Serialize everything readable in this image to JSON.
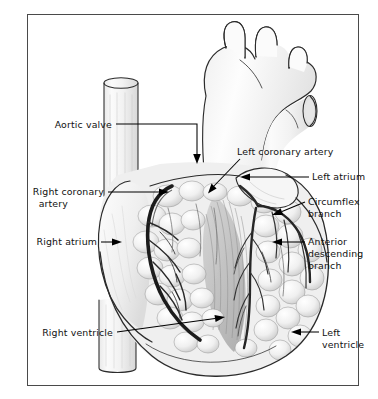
{
  "figure": {
    "frame": {
      "present": true,
      "color": "#4a4a4a"
    },
    "background": "#ffffff",
    "ink_color": "#2b2b2b"
  },
  "labels": [
    {
      "id": "aortic-valve",
      "text": "Aortic valve",
      "side": "left",
      "text_x": 112,
      "text_y": 128,
      "pointer": "arrow-down",
      "leader": "M116,124 L197,124 L197,157",
      "arrow_tip": {
        "x": 197,
        "y": 163
      },
      "arrow_dir": "down"
    },
    {
      "id": "right-coronary-artery",
      "text": "Right coronary",
      "text2": "artery",
      "side": "left",
      "text_x": 104,
      "text_y": 195,
      "text2_y": 207,
      "pointer": "arrow-right",
      "leader": "M108,192 L160,192",
      "arrow_tip": {
        "x": 168,
        "y": 192
      },
      "arrow_dir": "right"
    },
    {
      "id": "right-atrium",
      "text": "Right atrium",
      "side": "left",
      "text_x": 97,
      "text_y": 245,
      "pointer": "arrow-right",
      "leader": "M101,242 L113,242",
      "arrow_tip": {
        "x": 122,
        "y": 242
      },
      "arrow_dir": "right"
    },
    {
      "id": "right-ventricle",
      "text": "Right ventricle",
      "side": "left",
      "text_x": 113,
      "text_y": 336,
      "pointer": "arrow-upright",
      "leader": "M117,332 L216,318",
      "arrow_tip": {
        "x": 225,
        "y": 317
      },
      "arrow_dir": "upright"
    },
    {
      "id": "left-coronary-artery",
      "text": "Left coronary artery",
      "side": "right",
      "text_x": 237,
      "text_y": 155,
      "pointer": "arrow-downleft",
      "leader": "M240,159 L215,185",
      "arrow_tip": {
        "x": 209,
        "y": 191
      },
      "arrow_dir": "downleft"
    },
    {
      "id": "left-atrium",
      "text": "Left atrium",
      "side": "right",
      "text_x": 312,
      "text_y": 180,
      "pointer": "arrow-left",
      "leader": "M309,177 L249,177",
      "arrow_tip": {
        "x": 241,
        "y": 177
      },
      "arrow_dir": "left"
    },
    {
      "id": "circumflex-branch",
      "text": "Circumflex",
      "text2": "branch",
      "side": "right",
      "text_x": 308,
      "text_y": 205,
      "text2_y": 217,
      "pointer": "arrow-left",
      "leader": "M305,202 L281,212",
      "arrow_tip": {
        "x": 273,
        "y": 215
      },
      "arrow_dir": "downleft"
    },
    {
      "id": "anterior-descending-branch",
      "text": "Anterior",
      "text2": "descending",
      "text3": "branch",
      "side": "right",
      "text_x": 308,
      "text_y": 245,
      "text2_y": 257,
      "text3_y": 269,
      "pointer": "arrow-left",
      "leader": "M305,242 L281,242",
      "arrow_tip": {
        "x": 273,
        "y": 242
      },
      "arrow_dir": "left"
    },
    {
      "id": "left-ventricle",
      "text": "Left",
      "text2": "ventricle",
      "side": "right",
      "text_x": 322,
      "text_y": 336,
      "text2_y": 348,
      "pointer": "arrow-left",
      "leader": "M319,332 L300,332",
      "arrow_tip": {
        "x": 292,
        "y": 332
      },
      "arrow_dir": "left"
    }
  ],
  "structures": [
    {
      "id": "aorta",
      "name": "aorta-ascending-arch"
    },
    {
      "id": "brachiocephalic",
      "name": "brachiocephalic-trunk"
    },
    {
      "id": "left-common-carotid",
      "name": "left-common-carotid-artery"
    },
    {
      "id": "left-subclavian",
      "name": "left-subclavian-artery"
    },
    {
      "id": "superior-vena-cava",
      "name": "superior-vena-cava-stump"
    },
    {
      "id": "pulmonary-trunk",
      "name": "pulmonary-trunk-stump"
    },
    {
      "id": "inferior-vena-cava",
      "name": "inferior-vena-cava-stump"
    },
    {
      "id": "right-atrium-body",
      "name": "right-atrium"
    },
    {
      "id": "right-ventricle-body",
      "name": "right-ventricle"
    },
    {
      "id": "left-ventricle-body",
      "name": "left-ventricle"
    },
    {
      "id": "left-atrial-appendage",
      "name": "left-atrial-appendage"
    },
    {
      "id": "epicardial-fat",
      "name": "epicardial-fat-lobules"
    },
    {
      "id": "coronary-vessels",
      "name": "coronary-vessel-network"
    }
  ]
}
